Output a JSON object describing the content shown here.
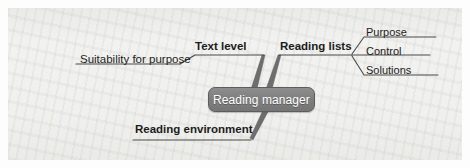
{
  "diagram": {
    "type": "mind-map",
    "title": "Reading manager",
    "central_node": {
      "label": "Reading manager",
      "fill_color": "#7f7f7f",
      "border_color": "#5d5d5d",
      "text_color": "#ffffff"
    },
    "background_color": "#f1f1ef",
    "line_color": "#4a4a4a",
    "branch_color": "#6e6e6e",
    "branches": [
      {
        "label": "Text level",
        "emphasis": "bold",
        "position": "upper-left",
        "children": [
          {
            "label": "Suitability for purpose",
            "emphasis": "regular",
            "children": []
          }
        ]
      },
      {
        "label": "Reading lists",
        "emphasis": "bold",
        "position": "upper-right",
        "children": [
          {
            "label": "Purpose",
            "emphasis": "regular",
            "children": []
          },
          {
            "label": "Control",
            "emphasis": "regular",
            "children": []
          },
          {
            "label": "Solutions",
            "emphasis": "regular",
            "children": []
          }
        ]
      },
      {
        "label": "Reading environment",
        "emphasis": "bold",
        "position": "lower-left",
        "children": []
      }
    ]
  }
}
